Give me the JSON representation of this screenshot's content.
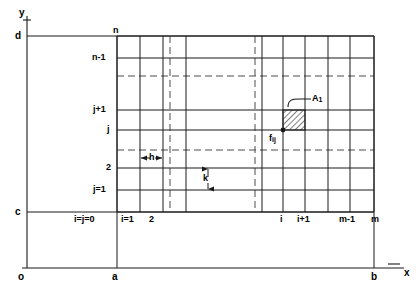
{
  "figure": {
    "axes": {
      "x_axis_label": "x",
      "y_axis_label": "y",
      "origin_label": "o",
      "x_ticks": [
        {
          "label": "a",
          "x": 115
        },
        {
          "label": "b",
          "x": 372
        }
      ],
      "y_ticks": [
        {
          "label": "c",
          "y": 212
        },
        {
          "label": "d",
          "y": 36
        }
      ]
    },
    "grid": {
      "left": 117,
      "right": 374,
      "top": 36,
      "bottom": 212,
      "h_spacing_label": "h",
      "k_spacing_label": "k",
      "column_labels": [
        {
          "label": "i=j=0",
          "x": 117
        },
        {
          "label": "i=1",
          "x": 140
        },
        {
          "label": "2",
          "x": 163
        },
        {
          "label": "i",
          "x": 283
        },
        {
          "label": "i+1",
          "x": 305
        },
        {
          "label": "m-1",
          "x": 350
        },
        {
          "label": "m",
          "x": 374
        }
      ],
      "row_labels": [
        {
          "label": "n",
          "y": 36
        },
        {
          "label": "n-1",
          "y": 58
        },
        {
          "label": "j+1",
          "y": 110
        },
        {
          "label": "j",
          "y": 130
        },
        {
          "label": "2",
          "y": 168
        },
        {
          "label": "j=1",
          "y": 190
        }
      ],
      "vertical_line_x": [
        117,
        140,
        163,
        186,
        262,
        283,
        305,
        328,
        350,
        374
      ],
      "vertical_dashed_x": [
        170,
        255
      ],
      "horizontal_line_y": [
        36,
        58,
        110,
        130,
        168,
        190,
        212
      ],
      "horizontal_dashed_y": [
        76,
        150
      ]
    },
    "annotations": {
      "cell_label": "A",
      "cell_label_sub": "1",
      "node_label": "f",
      "node_label_sub": "ij",
      "shaded_cell": {
        "x": 283,
        "y": 110,
        "w": 22,
        "h": 20
      }
    },
    "colors": {
      "line": "#1a1a1a",
      "dashed": "#555555",
      "hatch": "#333333",
      "background": "#ffffff"
    }
  }
}
